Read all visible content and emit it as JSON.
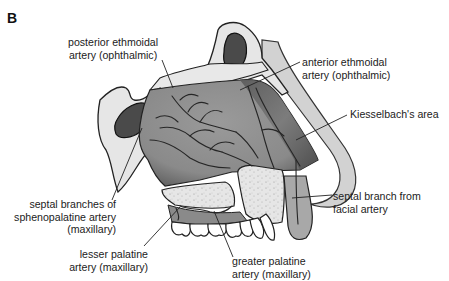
{
  "figure": {
    "panel_letter": "B",
    "colors": {
      "background": "#ffffff",
      "septum_mucosa": "#8e8e8e",
      "septum_shadow": "#6a6a6a",
      "bone": "#e4e4e4",
      "sinus_cavity": "#4a4a4a",
      "skin_outline": "#cfcfcf",
      "vessels": "#2a2a2a",
      "leader_lines": "#222222",
      "text": "#222222"
    }
  },
  "labels": {
    "posterior_ethmoidal": {
      "line1": "posterior ethmoidal",
      "line2": "artery (ophthalmic)"
    },
    "anterior_ethmoidal": {
      "line1": "anterior ethmoidal",
      "line2": "artery (ophthalmic)"
    },
    "kiesselbach": {
      "line1": "Kiesselbach's area"
    },
    "septal_branches_sphenopalatine": {
      "line1": "septal branches of",
      "line2": "sphenopalatine artery",
      "line3": "(maxillary)"
    },
    "septal_branch_facial": {
      "line1": "septal branch from",
      "line2": "facial artery"
    },
    "lesser_palatine": {
      "line1": "lesser palatine",
      "line2": "artery (maxillary)"
    },
    "greater_palatine": {
      "line1": "greater palatine",
      "line2": "artery (maxillary)"
    }
  }
}
